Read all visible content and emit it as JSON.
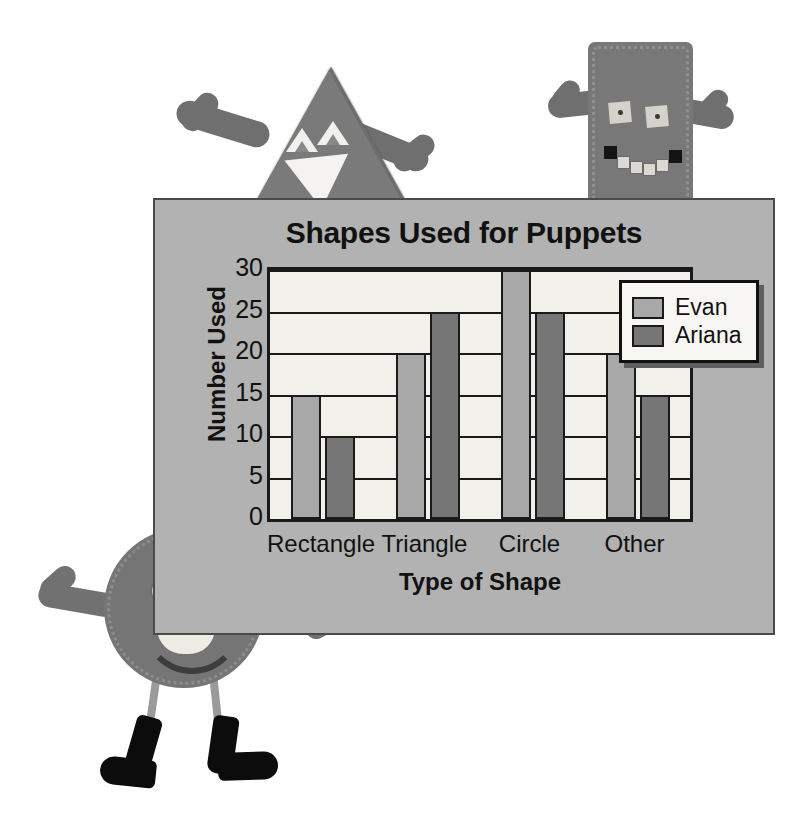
{
  "chart_data": {
    "type": "bar",
    "title": "Shapes Used for Puppets",
    "xlabel": "Type of Shape",
    "ylabel": "Number Used",
    "categories": [
      "Rectangle",
      "Triangle",
      "Circle",
      "Other"
    ],
    "series": [
      {
        "name": "Evan",
        "color": "#a8a8a8",
        "values": [
          15,
          20,
          30,
          20
        ]
      },
      {
        "name": "Ariana",
        "color": "#767676",
        "values": [
          10,
          25,
          25,
          15
        ]
      }
    ],
    "ylim": [
      0,
      30
    ],
    "yticks": [
      "0",
      "5",
      "10",
      "15",
      "20",
      "25",
      "30"
    ],
    "grid": true,
    "legend_position": "top-right"
  },
  "photo": {
    "puppet_triangle_name": "triangle-puppet",
    "puppet_rectangle_name": "rectangle-puppet",
    "puppet_circle_name": "circle-puppet"
  },
  "colors": {
    "panel_background": "#b2b2b2",
    "plot_background": "#f2f0eb",
    "axis": "#1a1a1a",
    "evan": "#a8a8a8",
    "ariana": "#767676"
  }
}
